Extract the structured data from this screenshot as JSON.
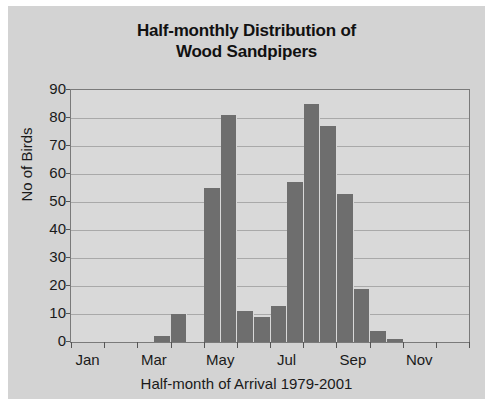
{
  "chart_data": {
    "type": "bar",
    "title": "Half-monthly Distribution of Wood Sandpipers",
    "title_line1": "Half-monthly Distribution of",
    "title_line2": "Wood Sandpipers",
    "xlabel": "Half-month of Arrival 1979-2001",
    "ylabel": "No of Birds",
    "ylim": [
      0,
      90
    ],
    "ytick_labels": [
      "90",
      "80",
      "70",
      "60",
      "50",
      "40",
      "30",
      "20",
      "10",
      "0"
    ],
    "ytick_values": [
      90,
      80,
      70,
      60,
      50,
      40,
      30,
      20,
      10,
      0
    ],
    "grid": true,
    "legend": "none",
    "bar_color": "#6e6e6e",
    "plot_bg_color": "#d9d9d9",
    "figure_bg_color": "#d3d3d3",
    "axis_color": "#7a7a7a",
    "month_tick_labels": [
      "Jan",
      "Mar",
      "May",
      "Jul",
      "Sep",
      "Nov"
    ],
    "month_tick_positions": [
      1,
      3,
      5,
      7,
      9,
      11
    ],
    "categories": [
      "Jan-1",
      "Jan-2",
      "Feb-1",
      "Feb-2",
      "Mar-1",
      "Mar-2",
      "Apr-1",
      "Apr-2",
      "May-1",
      "May-2",
      "Jun-1",
      "Jun-2",
      "Jul-1",
      "Jul-2",
      "Aug-1",
      "Aug-2",
      "Sep-1",
      "Sep-2",
      "Oct-1",
      "Oct-2",
      "Nov-1",
      "Nov-2",
      "Dec-1",
      "Dec-2"
    ],
    "values": [
      0,
      0,
      0,
      0,
      0,
      2,
      10,
      0,
      55,
      81,
      11,
      9,
      13,
      57,
      85,
      77,
      53,
      19,
      4,
      1,
      0,
      0,
      0,
      0
    ]
  }
}
